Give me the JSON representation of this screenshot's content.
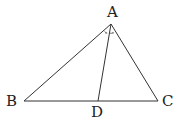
{
  "diagram": {
    "type": "triangle-with-angle-bisector",
    "points": {
      "A": {
        "label": "A",
        "x": 111,
        "y": 24
      },
      "B": {
        "label": "B",
        "x": 24,
        "y": 101
      },
      "C": {
        "label": "C",
        "x": 158,
        "y": 101
      },
      "D": {
        "label": "D",
        "x": 98,
        "y": 101
      }
    },
    "segments": [
      [
        "A",
        "B"
      ],
      [
        "A",
        "C"
      ],
      [
        "B",
        "C"
      ],
      [
        "A",
        "D"
      ]
    ],
    "angle_marks": [
      {
        "vertex": "A",
        "between": [
          "B",
          "D"
        ],
        "style": "dot"
      },
      {
        "vertex": "A",
        "between": [
          "D",
          "C"
        ],
        "style": "dot"
      }
    ],
    "labels": {
      "A": "A",
      "B": "B",
      "C": "C",
      "D": "D"
    },
    "stroke_color": "#333333"
  }
}
